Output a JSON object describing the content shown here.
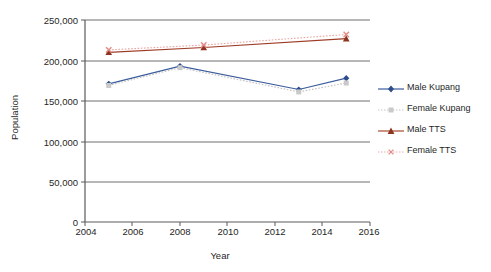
{
  "chart_data": {
    "type": "line",
    "title": "",
    "xlabel": "Year",
    "ylabel": "Population",
    "xlim": [
      2004,
      2016
    ],
    "ylim": [
      0,
      250000
    ],
    "grid": true,
    "legend_position": "right",
    "xticks": [
      "2004",
      "2006",
      "2008",
      "2010",
      "2012",
      "2014",
      "2016"
    ],
    "yticks": [
      "0",
      "50,000",
      "100,000",
      "150,000",
      "200,000",
      "250,000"
    ],
    "series": [
      {
        "name": "Male Kupang",
        "color": "#3a5b9c",
        "marker": "diamond",
        "linestyle": "solid",
        "x": [
          2005,
          2008,
          2013,
          2015
        ],
        "values": [
          171000,
          193000,
          164000,
          178000
        ]
      },
      {
        "name": "Female Kupang",
        "color": "#c0c0c0",
        "marker": "square",
        "linestyle": "dotted",
        "x": [
          2005,
          2008,
          2013,
          2015
        ],
        "values": [
          169000,
          191000,
          161000,
          172000
        ]
      },
      {
        "name": "Male TTS",
        "color": "#9e3b26",
        "marker": "triangle",
        "linestyle": "solid",
        "x": [
          2005,
          2009,
          2015
        ],
        "values": [
          210000,
          216000,
          227000
        ]
      },
      {
        "name": "Female TTS",
        "color": "#e8a6a0",
        "marker": "cross",
        "linestyle": "dotted",
        "x": [
          2005,
          2009,
          2015
        ],
        "values": [
          213000,
          219000,
          232000
        ]
      }
    ]
  },
  "legend": {
    "items": [
      {
        "label": "Male Kupang"
      },
      {
        "label": "Female Kupang"
      },
      {
        "label": "Male TTS"
      },
      {
        "label": "Female TTS"
      }
    ]
  },
  "axes": {
    "ylabel": "Population",
    "xlabel": "Year"
  }
}
